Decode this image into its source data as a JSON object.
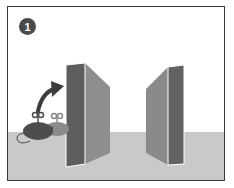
{
  "panel": {
    "step_number": "1",
    "colors": {
      "frame_border": "#3a3a3a",
      "background": "#ffffff",
      "floor": "#c9c9c9",
      "badge": "#4a4a4a",
      "wall_front": "#5f5f5f",
      "wall_side": "#8a8a8a",
      "mouse": "#4d4d4d",
      "arrow": "#3c3c3c"
    }
  }
}
